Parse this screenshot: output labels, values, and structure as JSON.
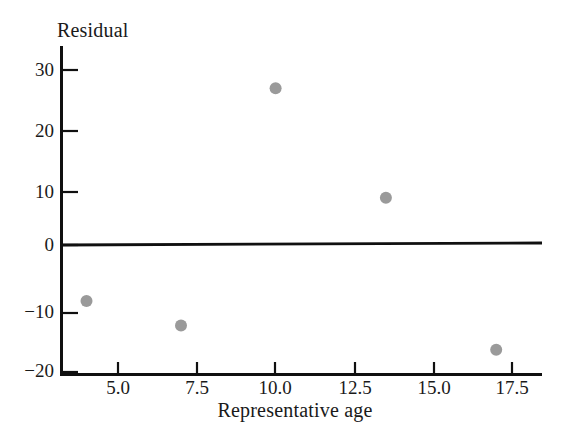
{
  "chart_data": {
    "type": "scatter",
    "title": "",
    "xlabel": "Representative age",
    "ylabel": "Residual",
    "xlim": [
      3.0,
      18.3
    ],
    "ylim": [
      -20,
      33
    ],
    "grid": false,
    "legend": "none",
    "reference_line": {
      "y": 0,
      "label": "zero-residual-line"
    },
    "xticks": [
      5.0,
      7.5,
      10.0,
      12.5,
      15.0,
      17.5
    ],
    "xtick_labels": [
      "5.0",
      "7.5",
      "10.0",
      "12.5",
      "15.0",
      "17.5"
    ],
    "yticks": [
      30,
      20,
      10,
      0,
      -10,
      -20
    ],
    "ytick_labels": [
      "30",
      "20",
      "10",
      "0",
      "−10",
      "−20"
    ],
    "marker": {
      "shape": "circle",
      "color": "#9a9a9a",
      "radius": 6
    },
    "points": [
      {
        "x": 4.0,
        "y": -8
      },
      {
        "x": 7.0,
        "y": -12
      },
      {
        "x": 10.0,
        "y": 27
      },
      {
        "x": 13.5,
        "y": 9
      },
      {
        "x": 17.0,
        "y": -16
      }
    ],
    "series": [
      {
        "name": "residuals",
        "x": [
          4.0,
          7.0,
          10.0,
          13.5,
          17.0
        ],
        "values": [
          -8,
          -12,
          27,
          9,
          -16
        ]
      }
    ]
  },
  "axes": {
    "y_title": "Residual",
    "x_title": "Representative age"
  }
}
